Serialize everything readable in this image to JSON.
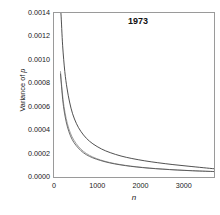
{
  "chart_data": {
    "type": "line",
    "title": "1973",
    "xlabel": "n",
    "ylabel_prefix": "Variance of ",
    "ylabel_italic": "p",
    "ylabel": "Variance of p",
    "xlim": [
      0,
      3700
    ],
    "ylim": [
      0.0,
      0.0014
    ],
    "grid": false,
    "legend": "none",
    "xticks": [
      0,
      1000,
      2000,
      3000
    ],
    "xtick_labels": [
      "0",
      "1000",
      "2000",
      "3000"
    ],
    "yticks": [
      0.0,
      0.0002,
      0.0004,
      0.0006,
      0.0008,
      0.001,
      0.0012,
      0.0014
    ],
    "ytick_labels": [
      "0.0000",
      "0.0002",
      "0.0004",
      "0.0006",
      "0.0008",
      "0.0010",
      "0.0012",
      "0.0014"
    ],
    "series": [
      {
        "name": "upper-curve",
        "color": "#3d3d3d",
        "width": 0.9,
        "x": [
          130,
          160,
          200,
          250,
          300,
          360,
          430,
          520,
          620,
          750,
          900,
          1100,
          1300,
          1550,
          1800,
          2100,
          2400,
          2750,
          3100,
          3450,
          3700
        ],
        "y": [
          0.0015,
          0.0014,
          0.00112,
          0.0009,
          0.00076,
          0.00064,
          0.00054,
          0.000455,
          0.00039,
          0.00033,
          0.000283,
          0.000239,
          0.000208,
          0.000179,
          0.000158,
          0.000138,
          0.000122,
          0.000106,
          9.25e-05,
          7.95e-05,
          7.05e-05
        ]
      },
      {
        "name": "middle-curve",
        "color": "#8a8a8a",
        "width": 0.8,
        "x": [
          150,
          175,
          210,
          255,
          310,
          380,
          460,
          560,
          680,
          820,
          980,
          1180,
          1400,
          1650,
          1900,
          2200,
          2500,
          2850,
          3200,
          3500,
          3700
        ],
        "y": [
          0.0009,
          0.00079,
          0.00066,
          0.00055,
          0.000455,
          0.000375,
          0.000315,
          0.000263,
          0.000219,
          0.000185,
          0.000158,
          0.000134,
          0.000115,
          9.95e-05,
          8.75e-05,
          7.65e-05,
          6.82e-05,
          6.01e-05,
          5.38e-05,
          4.94e-05,
          4.68e-05
        ]
      },
      {
        "name": "lower-curve",
        "color": "#4a4a4a",
        "width": 0.8,
        "x": [
          150,
          175,
          210,
          255,
          310,
          380,
          460,
          560,
          680,
          820,
          980,
          1180,
          1400,
          1650,
          1900,
          2200,
          2500,
          2850,
          3200,
          3500,
          3700
        ],
        "y": [
          0.00088,
          0.00077,
          0.00063,
          0.00052,
          0.000428,
          0.000352,
          0.000295,
          0.000248,
          0.000207,
          0.000176,
          0.000152,
          0.00013,
          0.000112,
          9.72e-05,
          8.58e-05,
          7.52e-05,
          6.72e-05,
          5.94e-05,
          5.33e-05,
          4.9e-05,
          4.65e-05
        ]
      }
    ]
  }
}
